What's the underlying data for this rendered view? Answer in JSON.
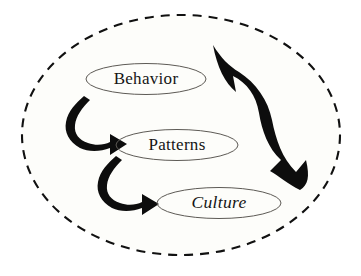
{
  "diagram": {
    "boundary": {
      "name": "system-boundary",
      "style": "dashed-ellipse",
      "color": "#111111",
      "fill": "#fdfdfa"
    },
    "nodes": [
      {
        "id": "behavior",
        "label": "Behavior",
        "style": "normal",
        "cx": 146,
        "cy": 79,
        "rx": 60,
        "ry": 15.5
      },
      {
        "id": "patterns",
        "label": "Patterns",
        "style": "normal",
        "cx": 177,
        "cy": 145,
        "rx": 61,
        "ry": 15.5
      },
      {
        "id": "culture",
        "label": "Culture",
        "style": "italic",
        "cx": 219,
        "cy": 203,
        "rx": 62,
        "ry": 15.5
      }
    ],
    "arrows": [
      {
        "id": "behavior-to-patterns",
        "name": "hook-arrow-behavior-to-patterns",
        "from": "behavior",
        "to": "patterns",
        "shape": "hook",
        "color": "#0d0d0d"
      },
      {
        "id": "patterns-to-culture",
        "name": "hook-arrow-patterns-to-culture",
        "from": "patterns",
        "to": "culture",
        "shape": "hook",
        "color": "#0d0d0d"
      },
      {
        "id": "culture-to-behavior",
        "name": "feedback-arrow-culture-to-behavior",
        "from": "culture",
        "to": "behavior",
        "shape": "large-curved-feedback",
        "color": "#0d0d0d"
      }
    ]
  }
}
